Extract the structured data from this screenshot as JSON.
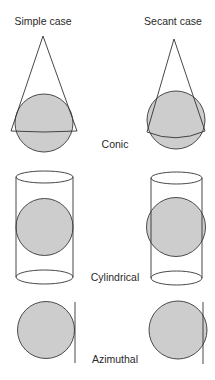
{
  "headers": {
    "simple": "Simple case",
    "secant": "Secant case"
  },
  "rows": [
    {
      "label": "Conic"
    },
    {
      "label": "Cylindrical"
    },
    {
      "label": "Azimuthal"
    }
  ],
  "colors": {
    "globe_fill": "#cdcdcd",
    "globe_stroke": "#4a4a4a",
    "surface_stroke": "#333333",
    "text": "#2a2a2a",
    "background": "#ffffff"
  }
}
